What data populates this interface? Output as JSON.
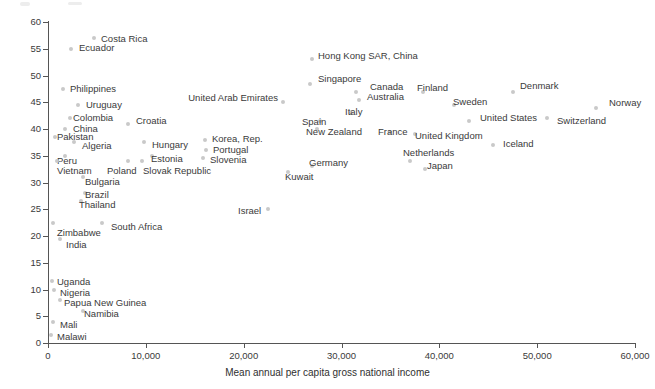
{
  "chart_data": {
    "type": "scatter",
    "title": "",
    "xlabel": "Mean annual per capita gross national income",
    "ylabel": "Incidence",
    "xlim": [
      0,
      60000
    ],
    "ylim": [
      0,
      60
    ],
    "xticks": [
      0,
      10000,
      20000,
      30000,
      40000,
      50000,
      60000
    ],
    "xticklabels": [
      "0",
      "10,000",
      "20,000",
      "30,000",
      "40,000",
      "50,000",
      "60,000"
    ],
    "yticks": [
      0,
      5,
      10,
      15,
      20,
      25,
      30,
      35,
      40,
      45,
      50,
      55,
      60
    ],
    "yticklabels": [
      "0",
      "5",
      "10",
      "15",
      "20",
      "25",
      "30",
      "35",
      "40",
      "45",
      "50",
      "55",
      "60"
    ],
    "grid": false,
    "legend": false,
    "marker_color": "#c9c9c9",
    "text_color": "#3a3a3a",
    "points": [
      {
        "label": "Costa Rica",
        "x": 4700,
        "y": 57.0,
        "lx": 101,
        "ly": 34,
        "align": "right"
      },
      {
        "label": "Ecuador",
        "x": 2400,
        "y": 55.0,
        "lx": 79,
        "ly": 43,
        "align": "right"
      },
      {
        "label": "Philippines",
        "x": 1500,
        "y": 47.5,
        "lx": 70,
        "ly": 84,
        "align": "right"
      },
      {
        "label": "Uruguay",
        "x": 3100,
        "y": 44.5,
        "lx": 86,
        "ly": 100,
        "align": "right"
      },
      {
        "label": "Colombia",
        "x": 2200,
        "y": 42.0,
        "lx": 73,
        "ly": 113,
        "align": "right"
      },
      {
        "label": "Croatia",
        "x": 8200,
        "y": 41.0,
        "lx": 136,
        "ly": 116,
        "align": "right"
      },
      {
        "label": "China",
        "x": 1700,
        "y": 40.0,
        "lx": 73,
        "ly": 124,
        "align": "right"
      },
      {
        "label": "Pakistan",
        "x": 700,
        "y": 38.5,
        "lx": 57,
        "ly": 132,
        "align": "right"
      },
      {
        "label": "Algeria",
        "x": 2700,
        "y": 37.5,
        "lx": 82,
        "ly": 141,
        "align": "right"
      },
      {
        "label": "Hungary",
        "x": 9800,
        "y": 37.5,
        "lx": 152,
        "ly": 140,
        "align": "right"
      },
      {
        "label": "Korea, Rep.",
        "x": 16000,
        "y": 38.0,
        "lx": 212,
        "ly": 134,
        "align": "right"
      },
      {
        "label": "Peru",
        "x": 1700,
        "y": 35.0,
        "lx": 57,
        "ly": 156,
        "align": "right"
      },
      {
        "label": "Estonia",
        "x": 10600,
        "y": 35.0,
        "lx": 151,
        "ly": 154,
        "align": "right"
      },
      {
        "label": "Portugal",
        "x": 16100,
        "y": 36.0,
        "lx": 213,
        "ly": 145,
        "align": "right"
      },
      {
        "label": "Vietnam",
        "x": 900,
        "y": 34.0,
        "lx": 57,
        "ly": 166,
        "align": "right"
      },
      {
        "label": "Poland",
        "x": 8200,
        "y": 34.0,
        "lx": 107,
        "ly": 166,
        "align": "right"
      },
      {
        "label": "Slovak Republic",
        "x": 9600,
        "y": 34.0,
        "lx": 143,
        "ly": 166,
        "align": "right"
      },
      {
        "label": "Slovenia",
        "x": 15800,
        "y": 34.5,
        "lx": 210,
        "ly": 155,
        "align": "right"
      },
      {
        "label": "Germany",
        "x": 27000,
        "y": 33.0,
        "lx": 309,
        "ly": 158,
        "align": "right"
      },
      {
        "label": "Netherlands",
        "x": 37000,
        "y": 34.0,
        "lx": 403,
        "ly": 148,
        "align": "right"
      },
      {
        "label": "Japan",
        "x": 38500,
        "y": 32.5,
        "lx": 427,
        "ly": 161,
        "align": "right"
      },
      {
        "label": "Bulgaria",
        "x": 3600,
        "y": 31.0,
        "lx": 85,
        "ly": 177,
        "align": "right"
      },
      {
        "label": "Kuwait",
        "x": 24500,
        "y": 32.0,
        "lx": 285,
        "ly": 172,
        "align": "right"
      },
      {
        "label": "Brazil",
        "x": 3800,
        "y": 28.0,
        "lx": 85,
        "ly": 190,
        "align": "right"
      },
      {
        "label": "Thailand",
        "x": 3400,
        "y": 26.5,
        "lx": 79,
        "ly": 200,
        "align": "right"
      },
      {
        "label": "Zimbabwe",
        "x": 500,
        "y": 22.5,
        "lx": 57,
        "ly": 228,
        "align": "right"
      },
      {
        "label": "South Africa",
        "x": 5500,
        "y": 22.5,
        "lx": 111,
        "ly": 222,
        "align": "right"
      },
      {
        "label": "Israel",
        "x": 22500,
        "y": 25.0,
        "lx": 238,
        "ly": 206,
        "align": "right"
      },
      {
        "label": "India",
        "x": 1200,
        "y": 19.5,
        "lx": 66,
        "ly": 240,
        "align": "right"
      },
      {
        "label": "Uganda",
        "x": 400,
        "y": 11.5,
        "lx": 57,
        "ly": 277,
        "align": "right"
      },
      {
        "label": "Nigeria",
        "x": 600,
        "y": 10.0,
        "lx": 60,
        "ly": 288,
        "align": "right"
      },
      {
        "label": "Papua New Guinea",
        "x": 1200,
        "y": 8.0,
        "lx": 64,
        "ly": 298,
        "align": "right"
      },
      {
        "label": "Namibia",
        "x": 3600,
        "y": 6.0,
        "lx": 84,
        "ly": 309,
        "align": "right"
      },
      {
        "label": "Mali",
        "x": 500,
        "y": 4.0,
        "lx": 60,
        "ly": 320,
        "align": "right"
      },
      {
        "label": "Malawi",
        "x": 300,
        "y": 1.5,
        "lx": 57,
        "ly": 332,
        "align": "right"
      },
      {
        "label": "United Arab Emirates",
        "x": 24000,
        "y": 45.0,
        "lx": 278,
        "ly": 93,
        "align": "left"
      },
      {
        "label": "Hong Kong SAR, China",
        "x": 27000,
        "y": 53.0,
        "lx": 318,
        "ly": 51,
        "align": "right"
      },
      {
        "label": "Singapore",
        "x": 26800,
        "y": 48.5,
        "lx": 318,
        "ly": 74,
        "align": "right"
      },
      {
        "label": "Canada",
        "x": 31500,
        "y": 47.0,
        "lx": 370,
        "ly": 82,
        "align": "right"
      },
      {
        "label": "Australia",
        "x": 31800,
        "y": 45.5,
        "lx": 367,
        "ly": 92,
        "align": "right"
      },
      {
        "label": "Finland",
        "x": 38300,
        "y": 47.0,
        "lx": 417,
        "ly": 83,
        "align": "right"
      },
      {
        "label": "Sweden",
        "x": 41500,
        "y": 44.5,
        "lx": 453,
        "ly": 97,
        "align": "right"
      },
      {
        "label": "Denmark",
        "x": 47500,
        "y": 47.0,
        "lx": 520,
        "ly": 81,
        "align": "right"
      },
      {
        "label": "Norway",
        "x": 56000,
        "y": 44.0,
        "lx": 609,
        "ly": 98,
        "align": "right"
      },
      {
        "label": "Italy",
        "x": 31000,
        "y": 43.0,
        "lx": 345,
        "ly": 107,
        "align": "right"
      },
      {
        "label": "Spain",
        "x": 27800,
        "y": 41.5,
        "lx": 302,
        "ly": 117,
        "align": "right"
      },
      {
        "label": "New Zealand",
        "x": 27500,
        "y": 40.0,
        "lx": 306,
        "ly": 127,
        "align": "right"
      },
      {
        "label": "France",
        "x": 35000,
        "y": 39.5,
        "lx": 378,
        "ly": 127,
        "align": "right"
      },
      {
        "label": "United Kingdom",
        "x": 37500,
        "y": 39.0,
        "lx": 415,
        "ly": 131,
        "align": "right"
      },
      {
        "label": "United States",
        "x": 43000,
        "y": 41.5,
        "lx": 480,
        "ly": 113,
        "align": "right"
      },
      {
        "label": "Switzerland",
        "x": 51000,
        "y": 42.0,
        "lx": 557,
        "ly": 116,
        "align": "right"
      },
      {
        "label": "Iceland",
        "x": 45500,
        "y": 37.0,
        "lx": 503,
        "ly": 139,
        "align": "right"
      }
    ]
  },
  "axis": {
    "x_title": "Mean annual per capita gross national income",
    "y_title": "Incidence"
  }
}
